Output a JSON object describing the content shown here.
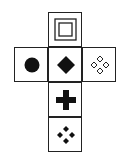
{
  "diagram": {
    "type": "cube-net",
    "faces": [
      {
        "position": "top",
        "symbol": "nested-squares"
      },
      {
        "position": "left",
        "symbol": "filled-circle"
      },
      {
        "position": "center",
        "symbol": "filled-diamond"
      },
      {
        "position": "right",
        "symbol": "four-hollow-diamonds"
      },
      {
        "position": "below-center",
        "symbol": "filled-cross"
      },
      {
        "position": "bottom",
        "symbol": "four-filled-diamonds"
      }
    ],
    "colors": {
      "stroke": "#222222",
      "fill": "#111111",
      "background": "#ffffff"
    }
  }
}
